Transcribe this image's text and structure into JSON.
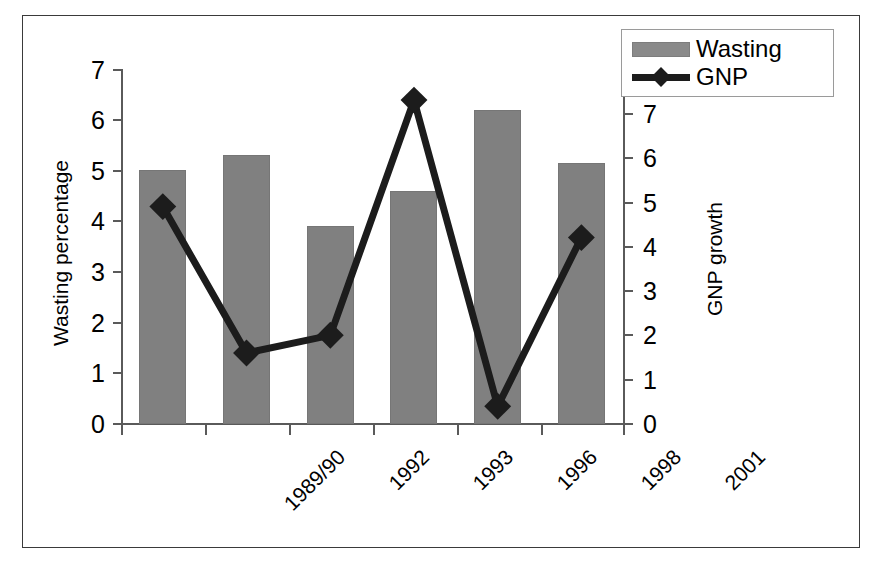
{
  "chart_data": {
    "type": "bar",
    "title": "",
    "subtitle": "",
    "xlabel": "",
    "categories": [
      "1989/90",
      "1992",
      "1993",
      "1996",
      "1998",
      "2001"
    ],
    "grid": false,
    "legend_position": "top-right",
    "axes": {
      "left": {
        "label": "Wasting percentage",
        "ticks": [
          "0",
          "1",
          "2",
          "3",
          "4",
          "5",
          "6",
          "7"
        ],
        "min": 0,
        "max": 7
      },
      "right": {
        "label": "GNP growth",
        "ticks": [
          "0",
          "1",
          "2",
          "3",
          "4",
          "5",
          "6",
          "7",
          "8"
        ],
        "min": 0,
        "max": 8
      }
    },
    "series": [
      {
        "name": "Wasting",
        "type": "bar",
        "axis": "left",
        "color": "#808080",
        "values": [
          5.0,
          5.3,
          3.9,
          4.6,
          6.2,
          5.15
        ]
      },
      {
        "name": "GNP",
        "type": "line",
        "axis": "right",
        "color": "#1c1c1c",
        "marker": "diamond",
        "values": [
          4.9,
          1.6,
          2.0,
          7.3,
          0.4,
          4.2
        ]
      }
    ]
  },
  "legend": {
    "items": [
      {
        "label": "Wasting",
        "marker": "bar-swatch"
      },
      {
        "label": "GNP",
        "marker": "line-diamond-swatch"
      }
    ]
  }
}
